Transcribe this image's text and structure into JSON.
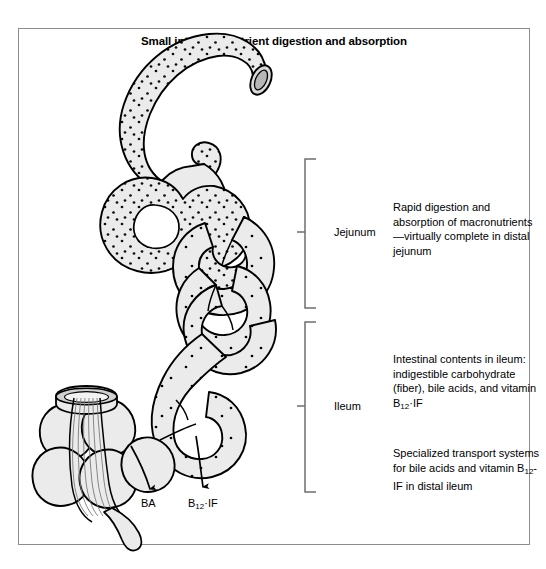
{
  "figure": {
    "title": "Small intestinal nutrient digestion and absorption",
    "border_color": "#8c8c8c",
    "bowel_fill": "#ebebeb",
    "outline_color": "#000000",
    "stipple_color": "#000000"
  },
  "brackets": [
    {
      "id": "jejunum",
      "label": "Jejunum",
      "paragraph": "Rapid digestion and absorption of macronutrients—virtually complete in distal jejunum"
    },
    {
      "id": "ileum",
      "label": "Ileum",
      "paragraph_1_prefix": "Intestinal contents in ileum:  indigestible carbohydrate (fiber), bile acids, and vitamin B",
      "paragraph_1_sub": "12",
      "paragraph_1_suffix": "·IF",
      "paragraph_2_prefix": "Specialized transport systems for bile acids and vitamin B",
      "paragraph_2_sub": "12",
      "paragraph_2_suffix": "-IF in distal ileum"
    }
  ],
  "arrow_labels": [
    {
      "id": "bile-acids",
      "text": "BA"
    },
    {
      "id": "b12-if",
      "prefix": "B",
      "sub": "12",
      "suffix": "·IF"
    }
  ]
}
